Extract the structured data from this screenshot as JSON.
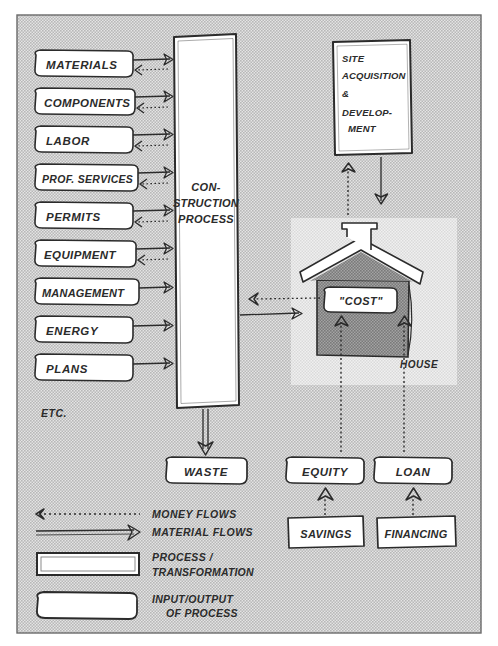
{
  "diagram": {
    "background_color": "#c9c9c9",
    "frame_color": "#555555",
    "ink_color": "#2b2b2b",
    "panel_color": "#dcdcdc",
    "house_color": "#8f8f8f",
    "node_fill": "#ffffff"
  },
  "inputs": {
    "items": [
      {
        "label": "MATERIALS"
      },
      {
        "label": "COMPONENTS"
      },
      {
        "label": "LABOR"
      },
      {
        "label": "PROF. SERVICES"
      },
      {
        "label": "PERMITS"
      },
      {
        "label": "EQUIPMENT"
      },
      {
        "label": "MANAGEMENT"
      },
      {
        "label": "ENERGY"
      },
      {
        "label": "PLANS"
      }
    ],
    "etc_label": "ETC."
  },
  "process": {
    "line1": "CON-",
    "line2": "STRUCTION",
    "line3": "PROCESS"
  },
  "site_box": {
    "line1": "SITE",
    "line2": "ACQUISITION",
    "line3": "&",
    "line4": "DEVELOP-",
    "line5": "MENT"
  },
  "house": {
    "cost_label": "\"COST\"",
    "house_label": "HOUSE"
  },
  "outputs": {
    "waste": "WASTE",
    "equity": "EQUITY",
    "loan": "LOAN",
    "savings": "SAVINGS",
    "financing": "FINANCING"
  },
  "legend": {
    "money_flows": "MONEY FLOWS",
    "material_flows": "MATERIAL FLOWS",
    "process_line1": "PROCESS /",
    "process_line2": "TRANSFORMATION",
    "io_line1": "INPUT/OUTPUT",
    "io_line2": "OF PROCESS"
  }
}
